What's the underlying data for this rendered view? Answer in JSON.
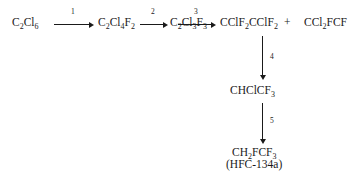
{
  "diagram": {
    "type": "reaction-scheme",
    "title": "",
    "species": [
      {
        "id": "hexachloroethane",
        "html": "C<sub>2</sub>Cl<sub>6</sub>",
        "plain": "C2Cl6"
      },
      {
        "id": "cfc-112",
        "html": "C<sub>2</sub>Cl<sub>4</sub>F<sub>2</sub>",
        "plain": "C2Cl4F2"
      },
      {
        "id": "cfc-113",
        "html": "C<sub>2</sub>Cl<sub>3</sub>F<sub>3</sub>",
        "plain": "C2Cl3F3"
      },
      {
        "id": "cfc-114",
        "html": "CClF<sub>2</sub>CClF<sub>2</sub>",
        "plain": "CClF2CClF2"
      },
      {
        "id": "cfc-114a",
        "html": "CCl<sub>2</sub>FCF",
        "plain": "CCl2FCF"
      },
      {
        "id": "hcfc-133a",
        "html": "CHClCF<sub>3</sub>",
        "plain": "CHClCF3"
      },
      {
        "id": "hfc-134a",
        "html": "CH<sub>2</sub>FCF<sub>3</sub>",
        "plain": "CH2FCF3"
      }
    ],
    "product_alt_name": "(HFC-134a)",
    "plus_sign": "+",
    "steps": [
      {
        "number": "1",
        "from": "hexachloroethane",
        "to": "cfc-112",
        "direction": "right"
      },
      {
        "number": "2",
        "from": "cfc-112",
        "to": "cfc-113",
        "direction": "right"
      },
      {
        "number": "3",
        "from": "cfc-113",
        "to": "cfc-114",
        "direction": "right"
      },
      {
        "number": "4",
        "from": "cfc-114",
        "to": "hcfc-133a",
        "direction": "down"
      },
      {
        "number": "5",
        "from": "hcfc-133a",
        "to": "hfc-134a",
        "direction": "down"
      }
    ],
    "colors": {
      "ink": "#1a1a1a",
      "background": "#ffffff"
    }
  }
}
